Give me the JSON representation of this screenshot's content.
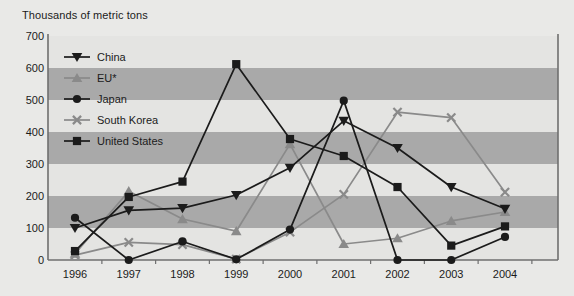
{
  "chart_data": {
    "type": "line",
    "title": "Thousands of metric tons",
    "xlabel": "",
    "ylabel": "Thousands of metric tons",
    "categories": [
      "1996",
      "1997",
      "1998",
      "1999",
      "2000",
      "2001",
      "2002",
      "2003",
      "2004"
    ],
    "x": [
      1996,
      1997,
      1998,
      1999,
      2000,
      2001,
      2002,
      2003,
      2004
    ],
    "ylim": [
      0,
      700
    ],
    "yticks": [
      0,
      100,
      200,
      300,
      400,
      500,
      600,
      700
    ],
    "grid": "alternating-horizontal-bands",
    "legend_position": "inside-upper-left",
    "series": [
      {
        "name": "China",
        "marker": "triangle-down",
        "color": "#1b1b1b",
        "values": [
          100,
          155,
          162,
          203,
          288,
          435,
          350,
          228,
          160
        ]
      },
      {
        "name": "EU*",
        "marker": "triangle-up",
        "color": "#8a8a8a",
        "values": [
          20,
          215,
          128,
          90,
          362,
          50,
          68,
          122,
          150
        ]
      },
      {
        "name": "Japan",
        "marker": "circle",
        "color": "#1b1b1b",
        "values": [
          132,
          0,
          58,
          2,
          95,
          498,
          0,
          0,
          72
        ]
      },
      {
        "name": "South Korea",
        "marker": "x-cross",
        "color": "#8a8a8a",
        "values": [
          15,
          55,
          48,
          3,
          87,
          205,
          462,
          445,
          212
        ]
      },
      {
        "name": "United States",
        "marker": "square",
        "color": "#1b1b1b",
        "values": [
          28,
          197,
          245,
          612,
          378,
          325,
          228,
          45,
          105
        ]
      }
    ]
  },
  "legend": {
    "items": [
      {
        "label": "China"
      },
      {
        "label": "EU*"
      },
      {
        "label": "Japan"
      },
      {
        "label": "South Korea"
      },
      {
        "label": "United States"
      }
    ]
  },
  "axes": {
    "y_tick_labels": [
      "700",
      "600",
      "500",
      "400",
      "300",
      "200",
      "100",
      "0"
    ],
    "x_tick_labels": [
      "1996",
      "1997",
      "1998",
      "1999",
      "2000",
      "2001",
      "2002",
      "2003",
      "2004"
    ]
  },
  "colors": {
    "background": "#e9e9e7",
    "band_dark": "#a9a9a9",
    "band_light": "#e4e4e2",
    "axis": "#6f6f6f",
    "dark_series": "#1b1b1b",
    "gray_series": "#8a8a8a",
    "text": "#1b1b1b"
  }
}
